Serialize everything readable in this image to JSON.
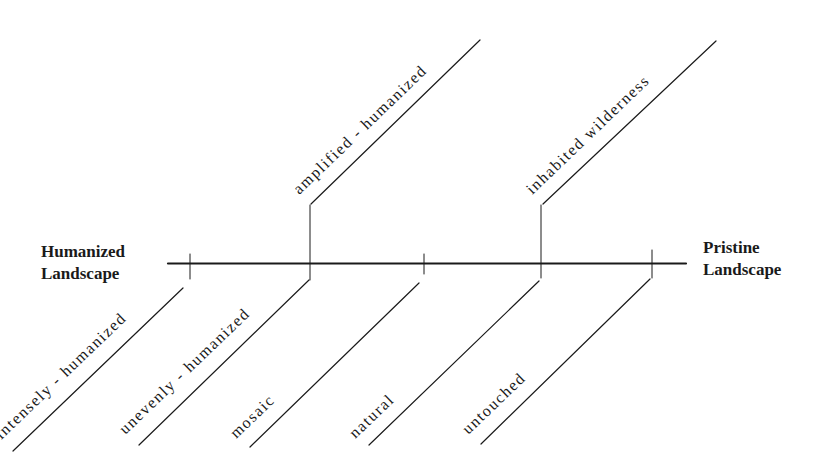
{
  "diagram": {
    "left_endpoint": {
      "line1": "Humanized",
      "line2": "Landscape"
    },
    "right_endpoint": {
      "line1": "Pristine",
      "line2": "Landscape"
    },
    "lower_categories": [
      "intensely - humanized",
      "unevenly - humanized",
      "mosaic",
      "natural",
      "untouched"
    ],
    "upper_categories": [
      "amplified - humanized",
      "inhabited wilderness"
    ],
    "line_color": "#1a1a1a"
  }
}
